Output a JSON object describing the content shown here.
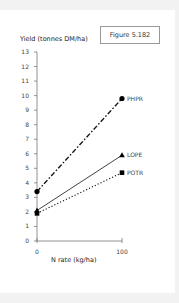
{
  "figure_label": "Figure 5.182",
  "chart_data": {
    "type": "line",
    "title": "",
    "xlabel": "N rate (kg/ha)",
    "ylabel": "Yield (tonnes DM/ha)",
    "x": [
      0,
      100
    ],
    "x_ticks": [
      "0",
      "100"
    ],
    "ylim": [
      0,
      13
    ],
    "y_ticks": [
      "0",
      "1",
      "2",
      "3",
      "4",
      "5",
      "6",
      "7",
      "8",
      "9",
      "10",
      "11",
      "12",
      "13"
    ],
    "grid": false,
    "series": [
      {
        "name": "PHPR",
        "values": [
          3.4,
          9.8
        ],
        "style": "dash-dot",
        "marker": "circle"
      },
      {
        "name": "LOPE",
        "values": [
          2.1,
          5.9
        ],
        "style": "solid",
        "marker": "triangle"
      },
      {
        "name": "POTR",
        "values": [
          1.9,
          4.7
        ],
        "style": "dotted",
        "marker": "square"
      }
    ]
  }
}
